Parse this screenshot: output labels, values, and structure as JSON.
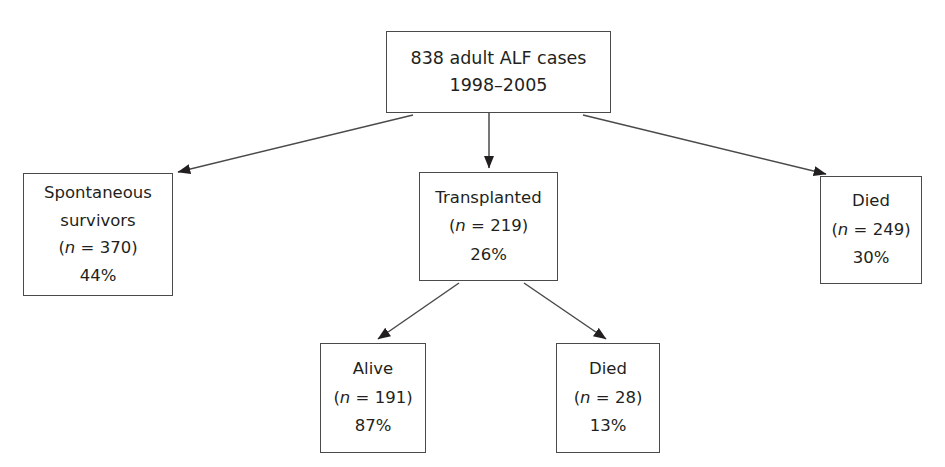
{
  "figure": {
    "type": "flowchart",
    "orientation": "top-down",
    "title_text": "",
    "background_color": "#ffffff",
    "line_color": "#4a4a4a",
    "text_color": "#231f20"
  },
  "nodes": {
    "root": {
      "id": "root",
      "label": "838 adult ALF cases 1998–2005",
      "lines": [
        "838 adult ALF cases",
        "1998–2005"
      ],
      "count": 838,
      "period": "1998–2005"
    },
    "spontaneous": {
      "id": "spontaneous-survivors",
      "label": "Spontaneous survivors",
      "lines": [
        "Spontaneous",
        "survivors"
      ],
      "n_prefix": "(",
      "n_var": "n",
      "n_eq": " = 370)",
      "n_text": "(n = 370)",
      "count": 370,
      "percent_text": "44%",
      "percent": 44
    },
    "transplanted": {
      "id": "transplanted",
      "label": "Transplanted",
      "lines": [
        "Transplanted"
      ],
      "n_prefix": "(",
      "n_var": "n",
      "n_eq": " = 219)",
      "n_text": "(n = 219)",
      "count": 219,
      "percent_text": "26%",
      "percent": 26
    },
    "died_overall": {
      "id": "died-overall",
      "label": "Died",
      "lines": [
        "Died"
      ],
      "n_prefix": "(",
      "n_var": "n",
      "n_eq": " = 249)",
      "n_text": "(n = 249)",
      "count": 249,
      "percent_text": "30%",
      "percent": 30
    },
    "alive": {
      "id": "alive",
      "label": "Alive",
      "lines": [
        "Alive"
      ],
      "n_prefix": "(",
      "n_var": "n",
      "n_eq": " = 191)",
      "n_text": "(n = 191)",
      "count": 191,
      "percent_text": "87%",
      "percent": 87
    },
    "died_post": {
      "id": "died-post-transplant",
      "label": "Died",
      "lines": [
        "Died"
      ],
      "n_prefix": "(",
      "n_var": "n",
      "n_eq": " = 28)",
      "n_text": "(n = 28)",
      "count": 28,
      "percent_text": "13%",
      "percent": 13
    }
  },
  "edges": [
    {
      "id": "root-to-spontaneous",
      "from": "root",
      "to": "spontaneous",
      "label": ""
    },
    {
      "id": "root-to-transplanted",
      "from": "root",
      "to": "transplanted",
      "label": ""
    },
    {
      "id": "root-to-died-overall",
      "from": "root",
      "to": "died_overall",
      "label": ""
    },
    {
      "id": "transplanted-to-alive",
      "from": "transplanted",
      "to": "alive",
      "label": ""
    },
    {
      "id": "transplanted-to-died-post",
      "from": "transplanted",
      "to": "died_post",
      "label": ""
    }
  ]
}
